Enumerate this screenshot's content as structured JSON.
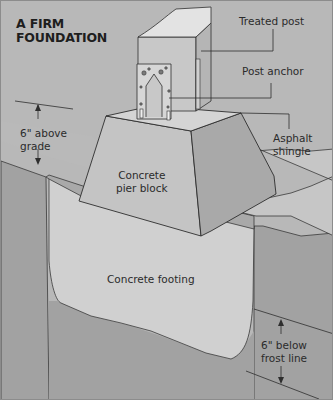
{
  "figure": {
    "title_line1": "A FIRM",
    "title_line2": "FOUNDATION",
    "labels": {
      "treated_post": "Treated post",
      "post_anchor": "Post anchor",
      "asphalt_line1": "Asphalt",
      "asphalt_line2": "shingle",
      "above_line1": "6\" above",
      "above_line2": "grade",
      "pier_line1": "Concrete",
      "pier_line2": "pier block",
      "footing": "Concrete footing",
      "below_line1": "6\" below",
      "below_line2": "frost line"
    },
    "colors": {
      "background": "#b8b8b8",
      "light_surface": "#d0d0d0",
      "pier_front": "#c4c4c4",
      "pier_side": "#a9a9a9",
      "soil_dark": "#a2a2a2",
      "post_face": "#c8c8c8",
      "anchor": "#d4d4d4",
      "ink": "#2b2b2b"
    }
  }
}
